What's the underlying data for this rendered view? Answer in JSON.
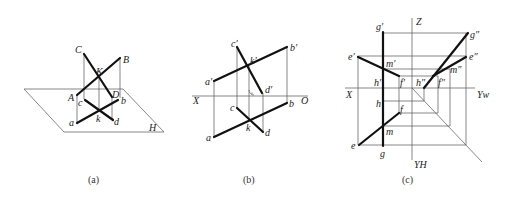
{
  "figures": [
    {
      "id": "a",
      "caption": "(a)",
      "plane_label": "H",
      "labels": {
        "C": "C",
        "B": "B",
        "K": "K",
        "A": "A",
        "D": "D",
        "c": "c",
        "b": "b",
        "k": "k",
        "a": "a",
        "d": "d"
      }
    },
    {
      "id": "b",
      "caption": "(b)",
      "axis": {
        "left": "X",
        "right": "O"
      },
      "labels": {
        "c_p": "c′",
        "b_p": "b′",
        "k_p": "k′",
        "a_p": "a′",
        "d_p": "d′",
        "c": "c",
        "b": "b",
        "k": "k",
        "a": "a",
        "d": "d"
      }
    },
    {
      "id": "c",
      "caption": "(c)",
      "axis": {
        "z": "Z",
        "x": "X",
        "yw": "Yw",
        "yh": "YH"
      },
      "labels": {
        "g_p": "g′",
        "g_pp": "g″",
        "e_p": "e′",
        "e_pp": "e″",
        "m_p": "m′",
        "m_pp": "m″",
        "h_p": "h′",
        "h_pp": "h″",
        "f_p": "f′",
        "f_pp": "f″",
        "h": "h",
        "f": "f",
        "m": "m",
        "e": "e",
        "g": "g"
      }
    }
  ]
}
